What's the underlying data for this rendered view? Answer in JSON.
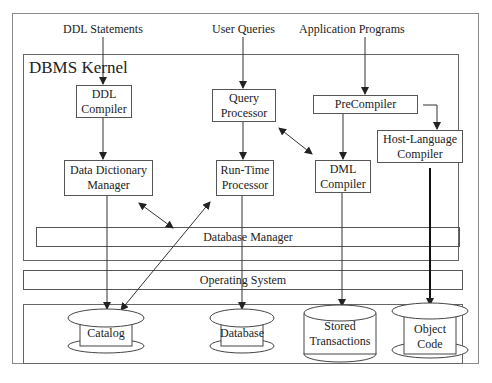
{
  "inputs": {
    "ddl_statements": "DDL Statements",
    "user_queries": "User Queries",
    "application_programs": "Application Programs"
  },
  "kernel": {
    "title": "DBMS Kernel",
    "ddl_compiler": [
      "DDL",
      "Compiler"
    ],
    "query_processor": [
      "Query",
      "Processor"
    ],
    "precompiler": "PreCompiler",
    "host_language_compiler": [
      "Host-Language",
      "Compiler"
    ],
    "data_dictionary_manager": [
      "Data Dictionary",
      "Manager"
    ],
    "runtime_processor": [
      "Run-Time",
      "Processor"
    ],
    "dml_compiler": [
      "DML",
      "Compiler"
    ],
    "database_manager": "Database Manager"
  },
  "operating_system": "Operating System",
  "storage": {
    "catalog": "Catalog",
    "database": "Database",
    "stored_transactions": [
      "Stored",
      "Transactions"
    ],
    "object_code": [
      "Object",
      "Code"
    ]
  },
  "colors": {
    "frame": "#8a8a8a",
    "box_border": "#555555",
    "arrow": "#333333",
    "background": "#ffffff"
  }
}
